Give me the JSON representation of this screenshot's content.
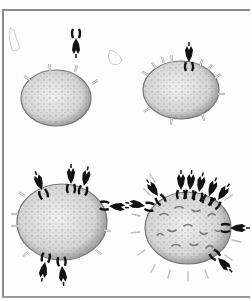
{
  "figure": {
    "panels": [
      {
        "id": "top-left",
        "cell": "cell with few sparse receptors, one dark molecule approaching from above"
      },
      {
        "id": "top-right",
        "cell": "cell with many light receptors, one dark molecule bound at top"
      },
      {
        "id": "bottom-left",
        "cell": "cell with several dark molecules bound around it"
      },
      {
        "id": "bottom-right",
        "cell": "spiky cell with many dark molecules clustered and receptors shedding"
      }
    ],
    "colors": {
      "cell_fill": "#d8d8d8",
      "cell_edge": "#6a6a6a",
      "molecule": "#111111",
      "receptor": "#b8b8b8",
      "frame": "#8a8a8a"
    }
  }
}
